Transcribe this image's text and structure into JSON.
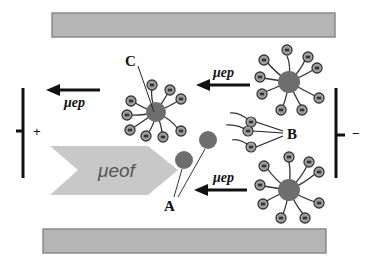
{
  "diagram": {
    "labels": {
      "A": "A",
      "B": "B",
      "C": "C",
      "mu_ep": "μep",
      "mu_eof": "μeof",
      "anode": "+",
      "cathode": "−"
    },
    "colors": {
      "wall": "#b5b5b5",
      "wall_border": "#8a8a8a",
      "eof_arrow": "#c8c8c8",
      "micelle_core": "#6e6e6e",
      "head_outer": "#a0a0a0",
      "head_inner": "#5a5a5a",
      "line": "#222222"
    }
  }
}
